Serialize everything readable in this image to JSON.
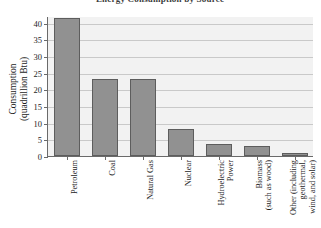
{
  "chart_data": {
    "type": "bar",
    "title": "Energy Consumption by Source",
    "xlabel": "",
    "ylabel": "Consumption (quadrillion Btu)",
    "ylabel_line1": "Consumption",
    "ylabel_line2": "(quadrillion Btu)",
    "ylim": [
      0,
      42
    ],
    "yticks": [
      0,
      5,
      10,
      15,
      20,
      25,
      30,
      35,
      40
    ],
    "ytick_labels": [
      "0",
      "5",
      "10",
      "15",
      "20",
      "25",
      "30",
      "35",
      "40"
    ],
    "grid": true,
    "legend": "none",
    "categories": [
      "Petroleum",
      "Coal",
      "Natural Gas",
      "Nuclear",
      "Hydroelectric Power",
      "Biomass (such as wood)",
      "Other (including geothermal, wind, and solar)"
    ],
    "category_lines": [
      [
        "Petroleum"
      ],
      [
        "Coal"
      ],
      [
        "Natural Gas"
      ],
      [
        "Nuclear"
      ],
      [
        "Hydroelectric",
        "Power"
      ],
      [
        "Biomass",
        "(such as wood)"
      ],
      [
        "Other (including",
        "geothermal,",
        "wind, and solar)"
      ]
    ],
    "values": [
      41.5,
      23.0,
      23.0,
      8.0,
      3.6,
      2.9,
      1.0
    ],
    "colors": {
      "bar_fill": "#919191",
      "bar_edge": "#5d5d5d",
      "plot_background": "#f2f2f2",
      "gridline": "#c9c9c9",
      "axis": "#6a6a6a",
      "text": "#1d1d1d"
    }
  }
}
